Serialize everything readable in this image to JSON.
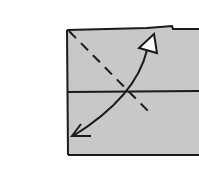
{
  "diagram": {
    "type": "origami-fold-step",
    "colors": {
      "background": "#ffffff",
      "paper": "#c8c8c8",
      "line": "#1a1a1a",
      "arrow_fill": "#ffffff"
    },
    "elements": [
      {
        "name": "paper",
        "kind": "rectangle"
      },
      {
        "name": "horizontal-crease",
        "kind": "solid-line"
      },
      {
        "name": "valley-fold-line",
        "kind": "dashed-line"
      },
      {
        "name": "fold-arrow",
        "kind": "curved-double-arrow",
        "heads": [
          "hollow-triangle",
          "open-v"
        ]
      }
    ]
  }
}
